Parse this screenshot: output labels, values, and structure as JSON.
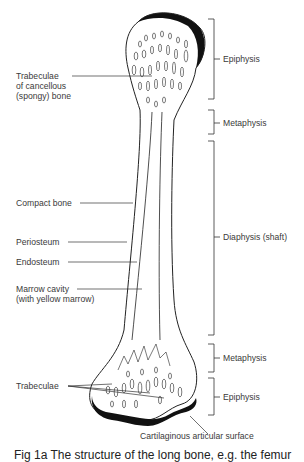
{
  "figure": {
    "left_labels": {
      "trabeculae_cancellous": [
        "Trabeculae",
        "of cancellous",
        "(spongy) bone"
      ],
      "compact_bone": "Compact bone",
      "periosteum": "Periosteum",
      "endosteum": "Endosteum",
      "marrow_cavity": [
        "Marrow cavity",
        "(with yellow marrow)"
      ],
      "trabeculae": "Trabeculae"
    },
    "right_regions": [
      {
        "name": "Epiphysis"
      },
      {
        "name": "Metaphysis"
      },
      {
        "name": "Diaphysis (shaft)"
      },
      {
        "name": "Metaphysis"
      },
      {
        "name": "Epiphysis"
      }
    ],
    "bottom_label": "Cartilaginous articular surface",
    "caption": "Fig 1a   The structure of the long bone, e.g. the femur"
  }
}
